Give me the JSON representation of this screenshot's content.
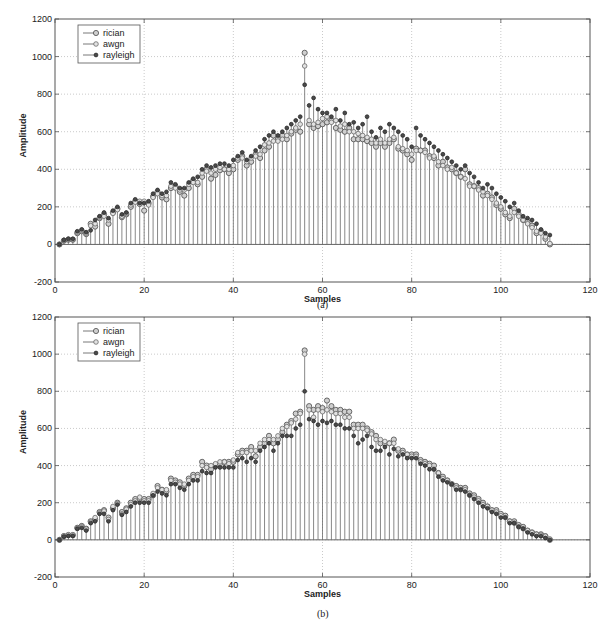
{
  "figure": {
    "captions": [
      "(a)",
      "(b)"
    ]
  },
  "chart_data": [
    {
      "type": "stem",
      "panel": "(a)",
      "title": "",
      "xlabel": "Samples",
      "ylabel": "Amplitude",
      "xlim": [
        0,
        120
      ],
      "ylim": [
        -200,
        1200
      ],
      "xticks": [
        0,
        20,
        40,
        60,
        80,
        100,
        120
      ],
      "yticks": [
        -200,
        0,
        200,
        400,
        600,
        800,
        1000,
        1200
      ],
      "grid": true,
      "legend": {
        "position": "upper-left",
        "entries": [
          "rician",
          "awgn",
          "rayleigh"
        ]
      },
      "x": [
        1,
        2,
        3,
        4,
        5,
        6,
        7,
        8,
        9,
        10,
        11,
        12,
        13,
        14,
        15,
        16,
        17,
        18,
        19,
        20,
        21,
        22,
        23,
        24,
        25,
        26,
        27,
        28,
        29,
        30,
        31,
        32,
        33,
        34,
        35,
        36,
        37,
        38,
        39,
        40,
        41,
        42,
        43,
        44,
        45,
        46,
        47,
        48,
        49,
        50,
        51,
        52,
        53,
        54,
        55,
        56,
        57,
        58,
        59,
        60,
        61,
        62,
        63,
        64,
        65,
        66,
        67,
        68,
        69,
        70,
        71,
        72,
        73,
        74,
        75,
        76,
        77,
        78,
        79,
        80,
        81,
        82,
        83,
        84,
        85,
        86,
        87,
        88,
        89,
        90,
        91,
        92,
        93,
        94,
        95,
        96,
        97,
        98,
        99,
        100,
        101,
        102,
        103,
        104,
        105,
        106,
        107,
        108,
        109,
        110,
        111
      ],
      "series": [
        {
          "name": "rician",
          "marker": "open-circle",
          "values": [
            0,
            20,
            25,
            25,
            60,
            70,
            55,
            110,
            95,
            140,
            160,
            110,
            170,
            190,
            145,
            160,
            200,
            230,
            215,
            180,
            220,
            255,
            280,
            250,
            240,
            300,
            310,
            280,
            260,
            300,
            340,
            320,
            360,
            400,
            350,
            370,
            395,
            400,
            380,
            400,
            450,
            470,
            420,
            440,
            480,
            460,
            500,
            520,
            580,
            560,
            580,
            560,
            590,
            610,
            600,
            1020,
            640,
            620,
            630,
            640,
            650,
            660,
            620,
            610,
            600,
            620,
            560,
            560,
            560,
            550,
            540,
            520,
            540,
            520,
            540,
            560,
            510,
            500,
            480,
            450,
            510,
            500,
            500,
            470,
            460,
            420,
            440,
            410,
            400,
            380,
            360,
            400,
            320,
            310,
            300,
            260,
            270,
            250,
            210,
            190,
            160,
            140,
            190,
            160,
            130,
            120,
            100,
            60,
            70,
            30,
            0
          ]
        },
        {
          "name": "awgn",
          "marker": "open-diamond",
          "values": [
            0,
            22,
            28,
            26,
            65,
            75,
            60,
            100,
            110,
            145,
            150,
            130,
            165,
            185,
            150,
            165,
            210,
            225,
            230,
            230,
            210,
            250,
            270,
            260,
            260,
            310,
            300,
            290,
            290,
            320,
            330,
            330,
            380,
            390,
            380,
            400,
            410,
            400,
            400,
            420,
            460,
            460,
            440,
            460,
            470,
            480,
            530,
            540,
            550,
            550,
            560,
            580,
            600,
            620,
            640,
            950,
            660,
            640,
            650,
            670,
            680,
            650,
            660,
            630,
            640,
            600,
            600,
            590,
            580,
            570,
            560,
            540,
            560,
            540,
            560,
            570,
            520,
            510,
            500,
            480,
            500,
            500,
            490,
            460,
            470,
            440,
            420,
            400,
            410,
            380,
            360,
            350,
            310,
            310,
            290,
            280,
            260,
            240,
            220,
            200,
            170,
            150,
            170,
            150,
            130,
            110,
            90,
            70,
            60,
            40,
            5
          ]
        },
        {
          "name": "rayleigh",
          "marker": "filled-circle",
          "values": [
            0,
            24,
            30,
            30,
            70,
            80,
            65,
            75,
            130,
            150,
            170,
            140,
            180,
            200,
            160,
            170,
            220,
            240,
            220,
            220,
            230,
            270,
            290,
            270,
            280,
            330,
            320,
            300,
            300,
            330,
            350,
            360,
            400,
            420,
            410,
            420,
            430,
            430,
            420,
            450,
            470,
            490,
            450,
            470,
            500,
            520,
            560,
            580,
            600,
            580,
            600,
            620,
            640,
            660,
            680,
            850,
            740,
            780,
            720,
            700,
            700,
            680,
            720,
            660,
            700,
            640,
            650,
            620,
            640,
            680,
            600,
            570,
            620,
            600,
            640,
            620,
            600,
            580,
            560,
            520,
            620,
            580,
            560,
            540,
            520,
            500,
            480,
            460,
            440,
            420,
            400,
            420,
            380,
            360,
            330,
            300,
            320,
            300,
            270,
            250,
            230,
            200,
            220,
            180,
            150,
            140,
            130,
            110,
            80,
            60,
            50
          ]
        }
      ]
    },
    {
      "type": "stem",
      "panel": "(b)",
      "title": "",
      "xlabel": "Samples",
      "ylabel": "Amplitude",
      "xlim": [
        0,
        120
      ],
      "ylim": [
        -200,
        1200
      ],
      "xticks": [
        0,
        20,
        40,
        60,
        80,
        100,
        120
      ],
      "yticks": [
        -200,
        0,
        200,
        400,
        600,
        800,
        1000,
        1200
      ],
      "grid": true,
      "legend": {
        "position": "upper-left",
        "entries": [
          "rician",
          "awgn",
          "rayleigh"
        ]
      },
      "x": [
        1,
        2,
        3,
        4,
        5,
        6,
        7,
        8,
        9,
        10,
        11,
        12,
        13,
        14,
        15,
        16,
        17,
        18,
        19,
        20,
        21,
        22,
        23,
        24,
        25,
        26,
        27,
        28,
        29,
        30,
        31,
        32,
        33,
        34,
        35,
        36,
        37,
        38,
        39,
        40,
        41,
        42,
        43,
        44,
        45,
        46,
        47,
        48,
        49,
        50,
        51,
        52,
        53,
        54,
        55,
        56,
        57,
        58,
        59,
        60,
        61,
        62,
        63,
        64,
        65,
        66,
        67,
        68,
        69,
        70,
        71,
        72,
        73,
        74,
        75,
        76,
        77,
        78,
        79,
        80,
        81,
        82,
        83,
        84,
        85,
        86,
        87,
        88,
        89,
        90,
        91,
        92,
        93,
        94,
        95,
        96,
        97,
        98,
        99,
        100,
        101,
        102,
        103,
        104,
        105,
        106,
        107,
        108,
        109,
        110,
        111
      ],
      "series": [
        {
          "name": "rician",
          "marker": "open-circle",
          "values": [
            0,
            20,
            25,
            25,
            65,
            75,
            60,
            100,
            110,
            150,
            160,
            120,
            170,
            200,
            150,
            170,
            200,
            220,
            220,
            220,
            220,
            240,
            290,
            270,
            260,
            330,
            320,
            310,
            290,
            330,
            350,
            350,
            420,
            400,
            380,
            400,
            410,
            420,
            420,
            420,
            460,
            480,
            480,
            500,
            450,
            500,
            520,
            560,
            520,
            540,
            580,
            620,
            640,
            680,
            690,
            1020,
            720,
            700,
            720,
            710,
            750,
            720,
            700,
            700,
            690,
            690,
            620,
            620,
            620,
            600,
            580,
            560,
            520,
            520,
            520,
            540,
            480,
            480,
            460,
            460,
            460,
            430,
            420,
            410,
            400,
            360,
            340,
            320,
            300,
            290,
            280,
            280,
            250,
            240,
            220,
            200,
            180,
            160,
            160,
            140,
            130,
            100,
            100,
            80,
            70,
            50,
            40,
            30,
            30,
            20,
            0
          ]
        },
        {
          "name": "awgn",
          "marker": "open-diamond",
          "values": [
            0,
            22,
            28,
            28,
            62,
            70,
            58,
            95,
            120,
            145,
            155,
            110,
            180,
            195,
            140,
            165,
            190,
            210,
            230,
            210,
            210,
            250,
            280,
            270,
            270,
            320,
            310,
            300,
            300,
            320,
            340,
            340,
            400,
            390,
            400,
            410,
            420,
            420,
            410,
            430,
            470,
            470,
            470,
            480,
            480,
            520,
            540,
            540,
            540,
            560,
            600,
            610,
            630,
            650,
            680,
            1000,
            700,
            660,
            700,
            690,
            700,
            690,
            680,
            680,
            660,
            660,
            600,
            600,
            600,
            590,
            570,
            540,
            540,
            530,
            520,
            520,
            490,
            470,
            460,
            450,
            450,
            420,
            410,
            400,
            380,
            360,
            330,
            320,
            300,
            280,
            270,
            270,
            240,
            230,
            210,
            190,
            180,
            160,
            150,
            130,
            120,
            100,
            90,
            70,
            60,
            50,
            40,
            30,
            25,
            20,
            5
          ]
        },
        {
          "name": "rayleigh",
          "marker": "filled-circle",
          "values": [
            0,
            18,
            22,
            22,
            60,
            65,
            50,
            90,
            100,
            140,
            140,
            100,
            160,
            190,
            135,
            150,
            180,
            200,
            200,
            200,
            200,
            240,
            260,
            250,
            240,
            300,
            300,
            280,
            270,
            300,
            320,
            320,
            370,
            360,
            360,
            390,
            390,
            390,
            390,
            390,
            430,
            440,
            420,
            440,
            420,
            480,
            500,
            520,
            480,
            520,
            560,
            560,
            560,
            600,
            620,
            800,
            650,
            640,
            620,
            640,
            630,
            640,
            620,
            620,
            600,
            600,
            560,
            520,
            540,
            560,
            500,
            480,
            480,
            500,
            460,
            490,
            450,
            460,
            440,
            440,
            440,
            410,
            400,
            380,
            380,
            340,
            320,
            310,
            300,
            270,
            270,
            260,
            240,
            220,
            200,
            180,
            170,
            150,
            140,
            120,
            120,
            90,
            90,
            70,
            60,
            40,
            30,
            20,
            20,
            10,
            0
          ]
        }
      ]
    }
  ]
}
